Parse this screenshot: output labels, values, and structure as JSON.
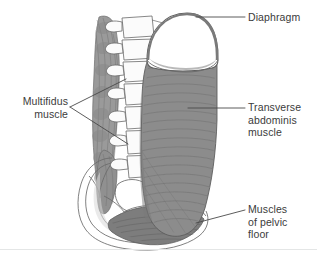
{
  "figure": {
    "background_color": "#ffffff",
    "baseline_rule_color": "#e4e6e6"
  },
  "palette": {
    "ink": "#3b3b3b",
    "outline": "#555555",
    "leader_line": "#4a4a4a",
    "muscle_mid_grey": "#8c8c8c",
    "muscle_dark_grey": "#7d7d7d",
    "muscle_shadow_grey": "#6f6f6f",
    "diaphragm_rim": "#7a7a7a",
    "bone_fill": "#fbfbfb",
    "bone_outline": "#6a6a6a",
    "multifidus_grey": "#9a9a9a",
    "fiber_line": "#6b6b6b"
  },
  "labels": {
    "diaphragm": "Diaphragm",
    "transverse_abdominis": "Transverse\nabdominis\nmuscle",
    "pelvic_floor": "Muscles\nof pelvic\nfloor",
    "multifidus": "Multifidus\nmuscle"
  },
  "anatomy": {
    "structures": [
      "diaphragm",
      "transverse-abdominis-muscle",
      "multifidus-muscle",
      "pelvic-floor-muscles",
      "lumbar-vertebrae",
      "sacrum",
      "pelvis"
    ],
    "vertebra_count": 6
  }
}
